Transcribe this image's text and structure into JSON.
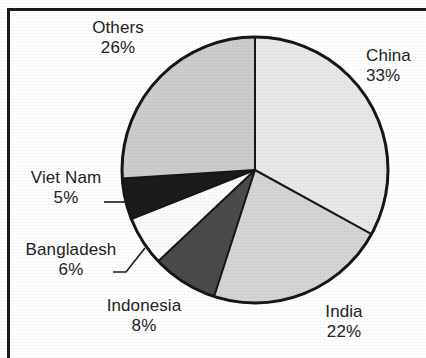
{
  "chart_data": {
    "type": "pie",
    "title": "",
    "subtitle": "",
    "xlabel": "",
    "ylabel": "",
    "legend_position": "none",
    "labels_position": "outside-with-leader-lines",
    "start_angle_deg": 0,
    "direction": "clockwise",
    "units": "percent",
    "total": 100,
    "categories": [
      "China",
      "India",
      "Indonesia",
      "Bangladesh",
      "Viet Nam",
      "Others"
    ],
    "values": [
      33,
      22,
      8,
      6,
      5,
      26
    ],
    "slices": [
      {
        "name": "China",
        "value": 33,
        "value_label": "33%",
        "color": "#e9e9e9",
        "start_deg": 0,
        "end_deg": 118.8,
        "leader_line": false
      },
      {
        "name": "India",
        "value": 22,
        "value_label": "22%",
        "color": "#d5d5d5",
        "start_deg": 118.8,
        "end_deg": 197.9,
        "leader_line": false
      },
      {
        "name": "Indonesia",
        "value": 8,
        "value_label": "8%",
        "color": "#4b4b4b",
        "start_deg": 197.9,
        "end_deg": 226.7,
        "leader_line": false
      },
      {
        "name": "Bangladesh",
        "value": 6,
        "value_label": "6%",
        "color": "#fbfbfb",
        "start_deg": 226.7,
        "end_deg": 248.3,
        "leader_line": true
      },
      {
        "name": "Viet Nam",
        "value": 5,
        "value_label": "5%",
        "color": "#1b1b1b",
        "start_deg": 248.3,
        "end_deg": 266.3,
        "leader_line": true
      },
      {
        "name": "Others",
        "value": 26,
        "value_label": "26%",
        "color": "#cdcdcd",
        "start_deg": 266.3,
        "end_deg": 360,
        "leader_line": false
      }
    ],
    "labels": {
      "china": {
        "name": "China",
        "pct": "33%"
      },
      "india": {
        "name": "India",
        "pct": "22%"
      },
      "indonesia": {
        "name": "Indonesia",
        "pct": "8%"
      },
      "bangladesh": {
        "name": "Bangladesh",
        "pct": "6%"
      },
      "vietnam": {
        "name": "Viet Nam",
        "pct": "5%"
      },
      "others": {
        "name": "Others",
        "pct": "26%"
      }
    },
    "geometry": {
      "center_x": 255,
      "center_y": 170,
      "radius": 133
    },
    "style": {
      "outline_color": "#161616",
      "outline_width": 3,
      "divider_color": "#161616",
      "divider_width": 2,
      "background": "#ffffff",
      "text_color": "#232323",
      "frame_color": "#1b1b1b"
    }
  }
}
